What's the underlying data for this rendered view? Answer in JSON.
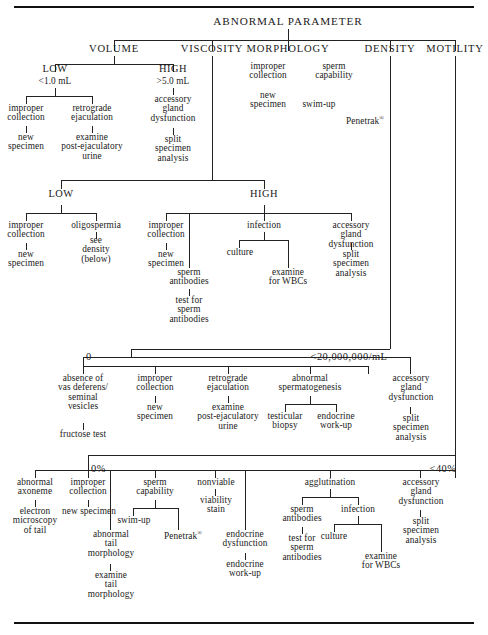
{
  "figure": {
    "root_label": "ABNORMAL PARAMETER",
    "categories": [
      {
        "id": "volume",
        "label": "VOLUME"
      },
      {
        "id": "viscosity",
        "label": "VISCOSITY"
      },
      {
        "id": "morphology",
        "label": "MORPHOLOGY"
      },
      {
        "id": "density",
        "label": "DENSITY"
      },
      {
        "id": "motility",
        "label": "MOTILITY"
      }
    ],
    "levels": {
      "volume_low": "LOW",
      "volume_low_value": "<1.0 mL",
      "volume_high": "HIGH",
      "volume_high_value": ">5.0 mL",
      "viscosity_low": "LOW",
      "viscosity_high": "HIGH",
      "density_zero": "0",
      "density_low": "<20,000,000/mL",
      "motility_zero": "0%",
      "motility_low": "<40%"
    },
    "nodes": {
      "improper_collection": "improper\ncollection",
      "improper_collection_one": "improper\ncollection",
      "new_specimen": "new\nspecimen",
      "new_specimen_one": "new specimen",
      "retrograde_ejaculation": "retrograde\nejaculation",
      "examine_post_ejaculatory_urine": "examine\npost-ejaculatory\nurine",
      "accessory_gland_dysfunction": "accessory\ngland\ndysfunction",
      "split_specimen_analysis": "split\nspecimen\nanalysis",
      "sperm_capability": "sperm\ncapability",
      "swim_up": "swim-up",
      "penetrak": "Penetrak",
      "penetrak_mark": "®",
      "oligospermia": "oligospermia",
      "see_density_below": "see\ndensity\n(below)",
      "infection": "infection",
      "culture": "culture",
      "examine_for_wbcs": "examine\nfor WBCs",
      "sperm_antibodies": "sperm\nantibodies",
      "test_for_sperm_antibodies": "test for\nsperm\nantibodies",
      "absence_of_vas": "absence of\nvas deferens/\nseminal\nvesicles",
      "fructose_test": "fructose test",
      "abnormal_spermatogenesis": "abnormal\nspermatogenesis",
      "testicular_biopsy": "testicular\nbiopsy",
      "endocrine_work_up": "endocrine\nwork-up",
      "abnormal_axoneme": "abnormal\naxoneme",
      "electron_microscopy_of_tail": "electron\nmicroscopy\nof tail",
      "abnormal_tail_morphology": "abnormal\ntail\nmorphology",
      "examine_tail_morphology": "examine\ntail\nmorphology",
      "nonviable": "nonviable",
      "viability_stain": "viability\nstain",
      "endocrine_dysfunction": "endocrine\ndysfunction",
      "endocrine_work_up_2": "endocrine\nwork-up",
      "agglutination": "agglutination",
      "test_for_sperm_antibodies_2": "test for\nsperm\nantibodies"
    },
    "colors": {
      "ink": "#111111",
      "line": "#222222",
      "background": "#ffffff"
    }
  }
}
